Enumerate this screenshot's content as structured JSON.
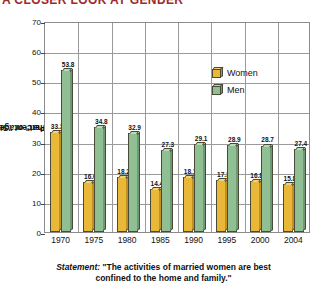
{
  "header": {
    "banner_text": "A CLOSER LOOK AT GENDER",
    "banner_color": "#9e2b2b"
  },
  "legend": {
    "position": "inside-top-center",
    "items": [
      {
        "name": "Women",
        "color": "#e9b839",
        "icon": "cube-icon"
      },
      {
        "name": "Men",
        "color": "#90bf93",
        "icon": "cube-icon"
      }
    ]
  },
  "caption": {
    "label": "Statement:",
    "line1": "\"The activities of married women are best",
    "line2": "confined to the home and family.\""
  },
  "chart_data": {
    "type": "bar",
    "title": "",
    "xlabel": "",
    "ylabel": "Percentage Agreeing \"Somewhat\" or \"Strongly\"",
    "ylabel_line1": "Percentage Agreeing",
    "ylabel_line2": "\"Somewhat\" or \"Strongly\"",
    "ylim": [
      0,
      70
    ],
    "yticks": [
      0,
      10,
      20,
      30,
      40,
      50,
      60,
      70
    ],
    "grid": true,
    "legend_position": "inside top center",
    "categories": [
      "1970",
      "1975",
      "1980",
      "1985",
      "1990",
      "1995",
      "2000",
      "2004"
    ],
    "series": [
      {
        "name": "Women",
        "color": "#e9b839",
        "values": [
          33.3,
          16.6,
          18.2,
          14.4,
          18.1,
          17.3,
          16.8,
          15.8
        ]
      },
      {
        "name": "Men",
        "color": "#90bf93",
        "values": [
          53.8,
          34.8,
          32.9,
          27.3,
          29.1,
          28.9,
          28.7,
          27.4
        ]
      }
    ]
  }
}
